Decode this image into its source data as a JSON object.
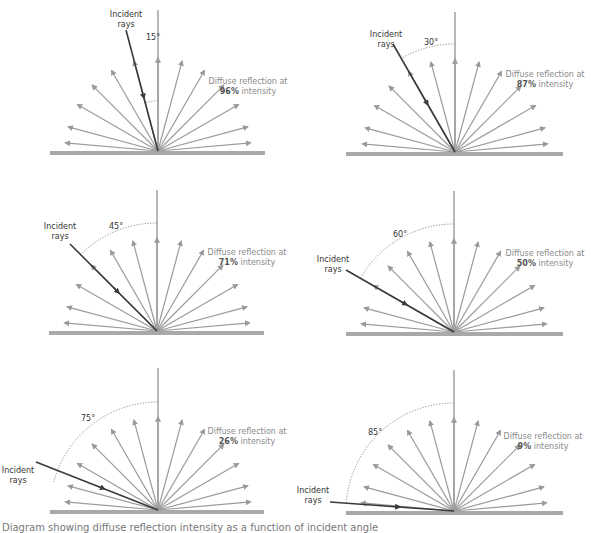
{
  "diagram": {
    "colors": {
      "surface": "#a9a9a9",
      "normal": "#a0a0a0",
      "reflected_ray": "#9a9a9a",
      "incident_ray": "#3a3a3a",
      "arc": "#888888"
    },
    "reflection_angles_deg": [
      -85,
      -75,
      -60,
      -45,
      -30,
      -15,
      0,
      15,
      30,
      45,
      60,
      75,
      85
    ],
    "panels": [
      {
        "id": "p15",
        "incident_angle": 15,
        "angle_label": "15°",
        "intensity": "96%",
        "incident_label": [
          "Incident",
          "rays"
        ],
        "diffuse_label": "Diffuse reflection at",
        "intensity_suffix": " intensity",
        "origin": [
          158,
          151
        ],
        "ray_length": 93,
        "normal_top": 10,
        "arc_radius": 50,
        "surface": [
          50,
          265
        ],
        "incident_start": [
          126,
          30
        ],
        "incident_label_pos": [
          126,
          17
        ],
        "angle_label_pos": [
          146,
          40
        ],
        "diffuse_label_pos": [
          248,
          84
        ]
      },
      {
        "id": "p30",
        "incident_angle": 30,
        "angle_label": "30°",
        "intensity": "87%",
        "incident_label": [
          "Incident",
          "rays"
        ],
        "diffuse_label": "Diffuse reflection at",
        "intensity_suffix": " intensity",
        "origin": [
          455,
          152
        ],
        "ray_length": 93,
        "normal_top": 12,
        "arc_radius": 108,
        "surface": [
          346,
          563
        ],
        "incident_start": [
          393,
          44
        ],
        "incident_label_pos": [
          386,
          37
        ],
        "angle_label_pos": [
          424,
          45
        ],
        "diffuse_label_pos": [
          545,
          77
        ]
      },
      {
        "id": "p45",
        "incident_angle": 45,
        "angle_label": "45°",
        "intensity": "71%",
        "incident_label": [
          "Incident",
          "rays"
        ],
        "diffuse_label": "Diffuse reflection at",
        "intensity_suffix": " intensity",
        "origin": [
          157,
          331
        ],
        "ray_length": 93,
        "normal_top": 190,
        "arc_radius": 108,
        "surface": [
          49,
          264
        ],
        "incident_start": [
          70,
          244
        ],
        "incident_label_pos": [
          60,
          229
        ],
        "angle_label_pos": [
          109,
          229
        ],
        "diffuse_label_pos": [
          247,
          255
        ]
      },
      {
        "id": "p60",
        "incident_angle": 60,
        "angle_label": "60°",
        "intensity": "50%",
        "incident_label": [
          "Incident",
          "rays"
        ],
        "diffuse_label": "Diffuse reflection at",
        "intensity_suffix": " intensity",
        "origin": [
          454,
          332
        ],
        "ray_length": 93,
        "normal_top": 191,
        "arc_radius": 108,
        "surface": [
          346,
          563
        ],
        "incident_start": [
          346,
          270
        ],
        "incident_label_pos": [
          333,
          262
        ],
        "angle_label_pos": [
          393,
          237
        ],
        "diffuse_label_pos": [
          545,
          256
        ]
      },
      {
        "id": "p75",
        "incident_angle": 75,
        "angle_label": "75°",
        "intensity": "26%",
        "incident_label": [
          "Incident",
          "rays"
        ],
        "diffuse_label": "Diffuse reflection at",
        "intensity_suffix": " intensity",
        "origin": [
          158,
          510
        ],
        "ray_length": 93,
        "normal_top": 368,
        "arc_radius": 108,
        "surface": [
          50,
          264
        ],
        "incident_start": [
          36,
          462
        ],
        "incident_label_pos": [
          18,
          473
        ],
        "angle_label_pos": [
          81,
          421
        ],
        "diffuse_label_pos": [
          247,
          434
        ]
      },
      {
        "id": "p85",
        "incident_angle": 85,
        "angle_label": "85°",
        "intensity": "9%",
        "incident_label": [
          "Incident",
          "rays"
        ],
        "diffuse_label": "Diffuse reflection at",
        "intensity_suffix": " intensity",
        "origin": [
          454,
          511
        ],
        "ray_length": 93,
        "normal_top": 370,
        "arc_radius": 108,
        "surface": [
          346,
          563
        ],
        "incident_start": [
          330,
          502
        ],
        "incident_label_pos": [
          313,
          493
        ],
        "angle_label_pos": [
          368,
          435
        ],
        "diffuse_label_pos": [
          543,
          439
        ]
      }
    ]
  },
  "caption": "Diagram showing diffuse reflection intensity as a function of incident angle"
}
